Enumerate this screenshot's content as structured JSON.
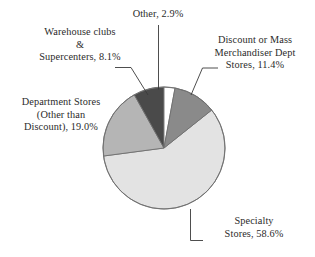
{
  "chart_data": {
    "type": "pie",
    "title": "",
    "subtitle": "",
    "xlabel": "",
    "ylabel": "",
    "grid": false,
    "legend_position": "none",
    "label_style": "external-with-leader-lines",
    "units": "percent",
    "total": 100.0,
    "start_angle_deg": 0,
    "direction": "clockwise",
    "categories": [
      "Other",
      "Discount or Mass Merchandiser Dept Stores",
      "Specialty Stores",
      "Department Stores (Other than Discount)",
      "Warehouse clubs & Supercenters"
    ],
    "values": [
      2.9,
      11.4,
      58.6,
      19.0,
      8.1
    ],
    "colors": [
      "#ffffff",
      "#8a8a8a",
      "#e3e3e3",
      "#b5b5b5",
      "#4a4a4a"
    ],
    "slices": [
      {
        "name": "Other",
        "value": 2.9,
        "value_text": "2.9%",
        "color": "#ffffff",
        "start_angle_deg": 0.0,
        "end_angle_deg": 10.44,
        "leader": "vertical"
      },
      {
        "name": "Discount or Mass Merchandiser Dept Stores",
        "value": 11.4,
        "value_text": "11.4%",
        "color": "#8a8a8a",
        "start_angle_deg": 10.44,
        "end_angle_deg": 51.48,
        "leader": "horizontal-diagonal"
      },
      {
        "name": "Specialty Stores",
        "value": 58.6,
        "value_text": "58.6%",
        "color": "#e3e3e3",
        "start_angle_deg": 51.48,
        "end_angle_deg": 262.44,
        "leader": "elbow"
      },
      {
        "name": "Department Stores (Other than Discount)",
        "value": 19.0,
        "value_text": "19.0%",
        "color": "#b5b5b5",
        "start_angle_deg": 262.44,
        "end_angle_deg": 330.84,
        "leader": "none"
      },
      {
        "name": "Warehouse clubs & Supercenters",
        "value": 8.1,
        "value_text": "8.1%",
        "color": "#4a4a4a",
        "start_angle_deg": 330.84,
        "end_angle_deg": 360.0,
        "leader": "horizontal-diagonal"
      }
    ]
  },
  "labels": {
    "other": {
      "line1": "Other, 2.9%"
    },
    "warehouse": {
      "line1": "Warehouse clubs",
      "line2": "&",
      "line3": "Supercenters, 8.1%"
    },
    "discount": {
      "line1": "Discount or Mass",
      "line2": "Merchandiser Dept",
      "line3": "Stores, 11.4%"
    },
    "department": {
      "line1": "Department Stores",
      "line2": "(Other than",
      "line3": "Discount), 19.0%"
    },
    "specialty": {
      "line1": "Specialty",
      "line2": "Stores, 58.6%"
    }
  },
  "style": {
    "outline_color": "#6f6f6f",
    "leader_color": "#3a3a3a",
    "text_color": "#2b2b2b",
    "background": "#ffffff"
  }
}
